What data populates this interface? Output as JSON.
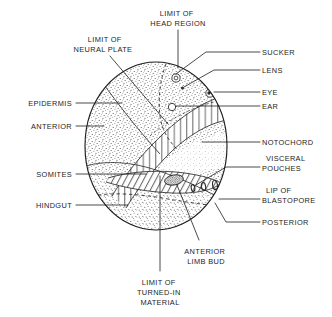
{
  "figure": {
    "type": "anatomical-diagram",
    "background_color": "#ffffff",
    "ink_color": "#1d1d1d"
  },
  "embryo": {
    "outline": {
      "shape": "circle",
      "cx": 156,
      "cy": 146,
      "rx": 71,
      "ry": 84
    },
    "regions": [
      {
        "name": "epidermis",
        "fill": "stipple"
      },
      {
        "name": "hindgut",
        "fill": "stipple"
      },
      {
        "name": "neural-plate",
        "fill": "vertical-hatch"
      },
      {
        "name": "somites",
        "fill": "diagonal-hatch"
      },
      {
        "name": "notochord",
        "fill": "light-stipple"
      }
    ],
    "features": [
      {
        "name": "sucker",
        "glyph": "double-circle",
        "cx": 176,
        "cy": 78
      },
      {
        "name": "lens",
        "glyph": "dot",
        "cx": 182,
        "cy": 88
      },
      {
        "name": "eye",
        "glyph": "circle-with-dot",
        "cx": 210,
        "cy": 93
      },
      {
        "name": "ear",
        "glyph": "circle",
        "cx": 172,
        "cy": 107
      },
      {
        "name": "anterior-limb-bud",
        "glyph": "dark-oval",
        "cx": 174,
        "cy": 180
      },
      {
        "name": "visceral-pouch-1",
        "glyph": "small-oval",
        "cx": 193,
        "cy": 187
      },
      {
        "name": "visceral-pouch-2",
        "glyph": "small-oval",
        "cx": 203,
        "cy": 186
      },
      {
        "name": "visceral-pouch-3",
        "glyph": "small-oval",
        "cx": 214,
        "cy": 185
      },
      {
        "name": "lip-of-blastopore",
        "glyph": "tiny-circle",
        "cx": 216,
        "cy": 200
      }
    ],
    "dashed_boundaries": [
      {
        "name": "limit-of-head-region"
      },
      {
        "name": "limit-of-turned-in-material"
      }
    ]
  },
  "labels": {
    "limit_of_head_region": {
      "lines": [
        "LIMIT OF",
        "HEAD REGION"
      ],
      "anchor": "middle",
      "x": 178,
      "y": 16
    },
    "limit_of_neural_plate": {
      "lines": [
        "LIMIT OF",
        "NEURAL PLATE"
      ],
      "anchor": "middle",
      "x": 103,
      "y": 42
    },
    "sucker": {
      "lines": [
        "SUCKER"
      ],
      "anchor": "start",
      "x": 262,
      "y": 55
    },
    "lens": {
      "lines": [
        "LENS"
      ],
      "anchor": "start",
      "x": 262,
      "y": 73
    },
    "eye": {
      "lines": [
        "EYE"
      ],
      "anchor": "start",
      "x": 262,
      "y": 95
    },
    "ear": {
      "lines": [
        "EAR"
      ],
      "anchor": "start",
      "x": 262,
      "y": 109
    },
    "epidermis": {
      "lines": [
        "EPIDERMIS"
      ],
      "anchor": "end",
      "x": 72,
      "y": 106
    },
    "anterior": {
      "lines": [
        "ANTERIOR"
      ],
      "anchor": "end",
      "x": 72,
      "y": 129
    },
    "notochord": {
      "lines": [
        "NOTOCHORD"
      ],
      "anchor": "start",
      "x": 262,
      "y": 145
    },
    "visceral_pouches": {
      "lines": [
        "VISCERAL",
        "POUCHES"
      ],
      "anchor": "start",
      "x": 262,
      "y": 161
    },
    "somites": {
      "lines": [
        "SOMITES"
      ],
      "anchor": "end",
      "x": 72,
      "y": 177
    },
    "lip_of_blastopore": {
      "lines": [
        "LIP OF",
        "BLASTOPORE"
      ],
      "anchor": "start",
      "x": 262,
      "y": 193
    },
    "hindgut": {
      "lines": [
        "HINDGUT"
      ],
      "anchor": "end",
      "x": 72,
      "y": 208
    },
    "posterior": {
      "lines": [
        "POSTERIOR"
      ],
      "anchor": "start",
      "x": 262,
      "y": 225
    },
    "anterior_limb_bud": {
      "lines": [
        "ANTERIOR",
        "LIMB BUD"
      ],
      "anchor": "middle",
      "x": 206,
      "y": 254
    },
    "limit_of_turned_in_material": {
      "lines": [
        "LIMIT OF",
        "TURNED-IN",
        "MATERIAL"
      ],
      "anchor": "middle",
      "x": 160,
      "y": 285
    }
  }
}
